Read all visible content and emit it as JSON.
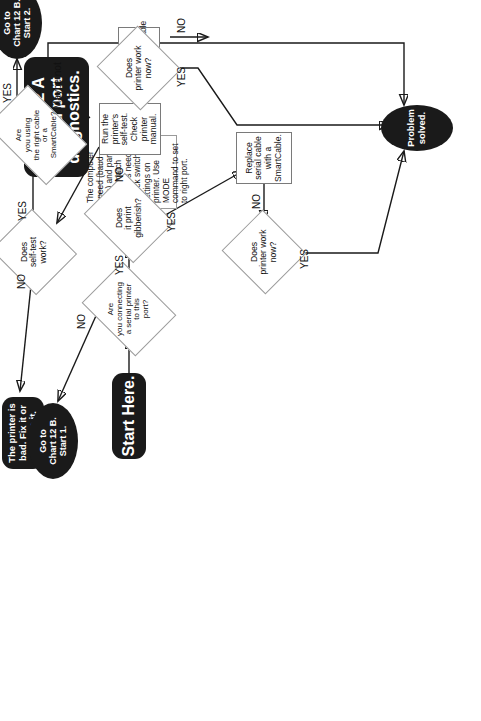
{
  "chart": {
    "title": "Chart 12 A Serial port diagnostics."
  },
  "nodes": {
    "chart_title": {
      "label": "Chart 12 A\nSerial port\ndiagnostics.",
      "type": "terminal"
    },
    "note_speed": {
      "label": "The computer speed (baud rate) and parity must match printer's needs. Check switch settings on printer. Use MODE command to set to right port.",
      "type": "note"
    },
    "start_here": {
      "label": "Start Here.",
      "type": "terminal"
    },
    "q_serial_port": {
      "label": "Are\nyou connecting\na serial printer to this\nport?",
      "type": "decision"
    },
    "q_gibberish": {
      "label": "Does\nit print gibberish?",
      "type": "decision"
    },
    "run_selftest": {
      "label": "Run the printer's self-test. Check printer manual.",
      "type": "process"
    },
    "q_selftest_work": {
      "label": "Does\nself-test\nwork?",
      "type": "decision"
    },
    "q_right_cable": {
      "label": "Are\nyou using\nthe right cable or a\nSmartCable?",
      "type": "decision"
    },
    "printer_bad": {
      "label": "The printer is bad. Fix it or replace it.",
      "type": "terminal"
    },
    "goto_start1": {
      "label": "Go to\nChart 12 B.\nStart 1.",
      "type": "oval"
    },
    "goto_start2": {
      "label": "Go to\nChart 12 B.\nStart 2.",
      "type": "oval"
    },
    "get_smartcable": {
      "label": "Get a SmartCable",
      "type": "process"
    },
    "q_work_now_a": {
      "label": "Does\nprinter work\nnow?",
      "type": "decision"
    },
    "q_work_now_b": {
      "label": "Does\nprinter work\nnow?",
      "type": "decision"
    },
    "replace_cable": {
      "label": "Replace serial cable with a SmartCable.",
      "type": "process"
    },
    "problem_solved": {
      "label": "Problem\nsolved.",
      "type": "oval"
    }
  },
  "edge_labels": {
    "serial_port_yes": "YES",
    "serial_port_no": "NO",
    "gibberish_yes": "YES",
    "gibberish_no": "NO",
    "selftest_yes": "YES",
    "selftest_no": "NO",
    "right_cable_yes": "YES",
    "right_cable_maybe": "Maybe not",
    "work_now_a_yes": "YES",
    "work_now_a_no": "NO",
    "work_now_b_yes": "YES",
    "work_now_b_no": "NO"
  },
  "colors": {
    "terminal_fill": "#1a1a1a",
    "terminal_text": "#ffffff",
    "outline": "#9c9c9c",
    "wire": "#1a1a1a",
    "background": "#ffffff"
  }
}
